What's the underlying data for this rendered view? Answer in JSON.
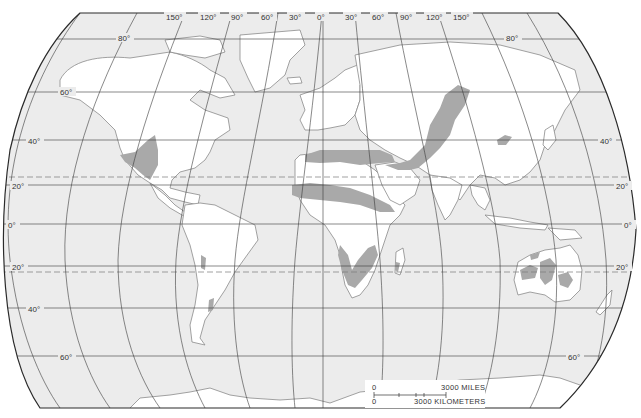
{
  "map": {
    "title": "World desert regions",
    "projection": "Robinson-style world projection",
    "colors": {
      "ocean": "#ececec",
      "land": "#ffffff",
      "desert": "#a9a9a9",
      "coastline": "#8a8a8a",
      "graticule": "#3a3a3a",
      "border": "#2a2a2a",
      "tropic_dashed": "#7a7a7a"
    },
    "longitude_labels": [
      "150°",
      "120°",
      "90°",
      "60°",
      "30°",
      "0°",
      "30°",
      "60°",
      "90°",
      "120°",
      "150°"
    ],
    "latitude_labels_left": [
      "80°",
      "60°",
      "40°",
      "20°",
      "0°",
      "20°",
      "40°",
      "60°"
    ],
    "latitude_labels_right": [
      "80°",
      "40°",
      "20°",
      "0°",
      "20°",
      "60°"
    ],
    "desert_regions": [
      "North American deserts (SW USA / N Mexico)",
      "Atacama / Peru coastal strip",
      "Patagonian desert",
      "Sahara (north band)",
      "Sahel band",
      "Arabian desert",
      "Iranian / Central Asian deserts",
      "Gobi desert",
      "Kalahari / Namib",
      "Madagascar south",
      "Australian deserts"
    ],
    "scale": {
      "miles_zero": "0",
      "miles_label": "3000  MILES",
      "km_zero": "0",
      "km_label": "3000  KILOMETERS"
    }
  }
}
